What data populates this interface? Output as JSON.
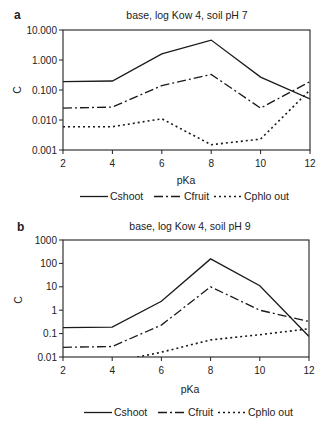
{
  "figure": {
    "panels": [
      {
        "label": "a",
        "title": "base, log Kow 4, soil pH 7"
      },
      {
        "label": "b",
        "title": "base, log Kow 4, soil pH 9"
      }
    ]
  },
  "chart_data": [
    {
      "type": "line",
      "panel": "a",
      "title": "base, log Kow 4, soil pH 7",
      "xlabel": "pKa",
      "ylabel": "C",
      "yscale": "log",
      "x": [
        2,
        4,
        6,
        8,
        10,
        12
      ],
      "xticks": [
        "2",
        "4",
        "6",
        "8",
        "10",
        "12"
      ],
      "xlim": [
        2,
        12
      ],
      "ylim": [
        0.001,
        10
      ],
      "yticks": [
        "0.001",
        "0.010",
        "0.100",
        "1.000",
        "10.000"
      ],
      "ytick_values": [
        0.001,
        0.01,
        0.1,
        1,
        10
      ],
      "grid": false,
      "legend_position": "bottom",
      "series": [
        {
          "name": "Cshoot",
          "style": "solid",
          "values": [
            0.19,
            0.2,
            1.6,
            4.6,
            0.27,
            0.05
          ]
        },
        {
          "name": "Cfruit",
          "style": "dashdot",
          "values": [
            0.025,
            0.027,
            0.14,
            0.33,
            0.025,
            0.19
          ]
        },
        {
          "name": "Cphlo out",
          "style": "dotted",
          "values": [
            0.006,
            0.006,
            0.011,
            0.0015,
            0.0023,
            0.1
          ]
        }
      ]
    },
    {
      "type": "line",
      "panel": "b",
      "title": "base, log Kow 4, soil pH 9",
      "xlabel": "pKa",
      "ylabel": "C",
      "yscale": "log",
      "x": [
        2,
        4,
        6,
        8,
        10,
        12
      ],
      "xticks": [
        "2",
        "4",
        "6",
        "8",
        "10",
        "12"
      ],
      "xlim": [
        2,
        12
      ],
      "ylim": [
        0.01,
        1000
      ],
      "yticks": [
        "0.01",
        "0.1",
        "1",
        "10",
        "100",
        "1000"
      ],
      "ytick_values": [
        0.01,
        0.1,
        1,
        10,
        100,
        1000
      ],
      "grid": false,
      "legend_position": "bottom",
      "series": [
        {
          "name": "Cshoot",
          "style": "solid",
          "values": [
            0.18,
            0.19,
            2.4,
            155,
            11,
            0.075
          ]
        },
        {
          "name": "Cfruit",
          "style": "dashdot",
          "values": [
            0.026,
            0.028,
            0.23,
            10,
            1.0,
            0.33
          ]
        },
        {
          "name": "Cphlo out",
          "style": "dotted",
          "values": [
            0.004,
            0.006,
            0.016,
            0.054,
            0.09,
            0.16
          ]
        }
      ]
    }
  ]
}
